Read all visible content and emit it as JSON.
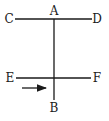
{
  "diagram": {
    "labels": {
      "A": "A",
      "B": "B",
      "C": "C",
      "D": "D",
      "E": "E",
      "F": "F"
    },
    "line_color": "#1a1a1a",
    "lines": [
      {
        "name": "CD",
        "from": "C",
        "to": "D"
      },
      {
        "name": "AB",
        "from": "A",
        "to": "B"
      },
      {
        "name": "EF",
        "from": "E",
        "to": "F"
      }
    ],
    "arrow": {
      "direction": "right",
      "near": "EF"
    }
  }
}
